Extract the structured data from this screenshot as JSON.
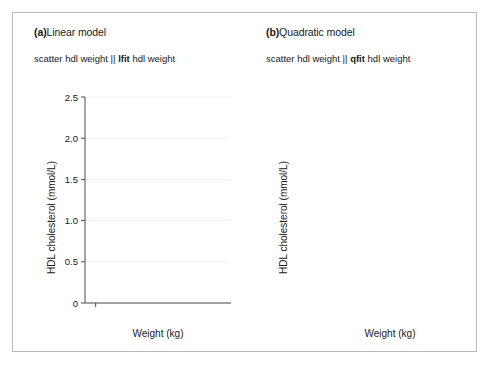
{
  "figure": {
    "background": "#ffffff",
    "border_color": "#b9b9b9",
    "marker_color": "#1c1c1c",
    "fit_color": "#666666",
    "axis_color": "#4d4d4d",
    "grid_color": "#f0f0f0"
  },
  "panels": [
    {
      "id": "a",
      "tag": "(a)",
      "title": "Linear model",
      "subtitle_pre": "scatter hdl weight || ",
      "subtitle_bold": "lfit",
      "subtitle_post": " hdl weight"
    },
    {
      "id": "b",
      "tag": "(b)",
      "title": "Quadratic model",
      "subtitle_pre": "scatter hdl weight || ",
      "subtitle_bold": "qfit",
      "subtitle_post": " hdl weight"
    }
  ],
  "chart_data": [
    {
      "type": "scatter",
      "panel": "a",
      "title": "(a) Linear model",
      "subtitle": "scatter hdl weight || lfit hdl weight",
      "xlabel": "Weight (kg)",
      "ylabel": "HDL cholesterol (mmol/L)",
      "xlim": [
        35,
        103
      ],
      "ylim": [
        0,
        2.5
      ],
      "xticks": [
        40,
        50,
        60,
        70,
        80,
        90,
        100
      ],
      "yticks": [
        0,
        0.5,
        1.0,
        1.5,
        2.0,
        2.5
      ],
      "ytick_labels": [
        "0",
        "0.5",
        "1.0",
        "1.5",
        "2.0",
        "2.5"
      ],
      "grid": "horizontal-faint",
      "legend": "none",
      "fit": {
        "kind": "linear",
        "label": "lfit",
        "x_start": 44.5,
        "y_start": 1.33,
        "x_end": 99.0,
        "y_end": 0.64
      },
      "x": [
        44.0,
        45.5,
        47.0,
        48.0,
        49.0,
        50.0,
        50.5,
        51.0,
        51.5,
        52.0,
        52.5,
        53.0,
        53.5,
        54.0,
        54.5,
        55.0,
        55.0,
        55.5,
        56.0,
        56.0,
        56.5,
        57.0,
        57.0,
        57.5,
        58.0,
        58.0,
        58.5,
        59.0,
        59.0,
        59.5,
        60.0,
        60.0,
        60.5,
        61.0,
        61.0,
        61.5,
        62.0,
        62.0,
        62.5,
        63.0,
        63.0,
        63.5,
        64.0,
        64.0,
        64.5,
        65.0,
        65.0,
        65.5,
        66.0,
        66.0,
        66.5,
        67.0,
        67.0,
        67.5,
        68.0,
        68.0,
        68.5,
        69.0,
        69.0,
        69.5,
        70.0,
        70.0,
        70.5,
        71.0,
        71.0,
        71.5,
        72.0,
        72.0,
        72.5,
        73.0,
        73.5,
        74.0,
        74.5,
        75.0,
        75.5,
        76.0,
        77.0,
        78.0,
        79.0,
        80.0,
        81.0,
        82.0,
        83.0,
        84.0,
        86.0,
        88.0,
        90.0,
        92.0,
        95.0,
        100.0,
        46.0,
        47.5,
        49.5,
        51.0,
        52.5,
        53.5,
        54.5,
        56.0,
        57.5,
        58.5,
        59.5,
        60.5,
        61.5,
        62.5,
        63.5,
        64.5,
        65.5,
        66.5,
        67.5,
        68.5,
        69.5,
        70.5,
        71.5,
        72.5,
        73.5,
        75.0,
        76.5,
        78.5,
        80.5,
        82.5,
        85.0,
        87.0,
        91.0,
        48.5,
        53.0,
        57.0,
        60.0,
        62.0,
        64.0,
        66.0,
        68.0,
        70.0,
        72.0,
        74.0,
        77.5,
        81.5,
        50.5,
        55.0,
        59.0,
        61.0,
        63.0,
        65.0,
        67.0,
        69.0,
        71.0,
        73.0,
        76.0,
        79.5,
        84.5
      ],
      "y": [
        1.92,
        1.74,
        1.36,
        1.27,
        1.11,
        1.38,
        1.23,
        1.05,
        1.48,
        1.3,
        0.99,
        1.18,
        1.52,
        1.4,
        1.07,
        1.29,
        0.88,
        1.56,
        1.21,
        0.96,
        1.34,
        1.13,
        1.63,
        1.42,
        1.25,
        0.91,
        1.08,
        1.31,
        1.5,
        1.16,
        1.02,
        1.27,
        1.44,
        1.19,
        0.93,
        1.36,
        1.1,
        1.28,
        0.85,
        1.22,
        1.41,
        1.04,
        1.15,
        0.97,
        1.33,
        1.2,
        0.9,
        1.26,
        1.09,
        1.38,
        1.01,
        1.17,
        0.83,
        1.24,
        1.06,
        1.31,
        0.95,
        1.13,
        1.29,
        0.87,
        1.18,
        1.02,
        1.22,
        0.94,
        1.1,
        1.25,
        0.86,
        1.15,
        1.03,
        1.19,
        0.92,
        1.08,
        1.21,
        0.98,
        1.12,
        0.89,
        1.05,
        1.16,
        0.95,
        1.09,
        0.84,
        1.14,
        1.01,
        1.23,
        0.97,
        1.07,
        1.92,
        1.03,
        1.1,
        0.37,
        1.85,
        1.6,
        1.2,
        0.81,
        1.44,
        1.05,
        0.94,
        1.35,
        1.01,
        1.47,
        0.79,
        1.26,
        0.88,
        1.12,
        0.97,
        1.53,
        0.82,
        1.3,
        0.91,
        1.06,
        0.76,
        1.21,
        0.99,
        0.86,
        1.18,
        0.93,
        1.08,
        0.8,
        1.24,
        0.95,
        0.89,
        1.02,
        0.74,
        1.17,
        0.85,
        0.71,
        1.03,
        1.95,
        1.66,
        1.31,
        0.78,
        1.09,
        0.72,
        1.28,
        0.83,
        0.96,
        1.4,
        1.56,
        0.75,
        1.33,
        0.68,
        1.49,
        0.87,
        1.14,
        0.64,
        1.07,
        0.98,
        0.73,
        1.19,
        0.9,
        0.66,
        1.25
      ]
    },
    {
      "type": "scatter",
      "panel": "b",
      "title": "(b) Quadratic model",
      "subtitle": "scatter hdl weight || qfit hdl weight",
      "xlabel": "Weight (kg)",
      "ylabel": "HDL cholesterol (mmol/L)",
      "xlim": [
        35,
        103
      ],
      "ylim": [
        0,
        2.5
      ],
      "xticks": [
        40,
        50,
        60,
        70,
        80,
        90,
        100
      ],
      "yticks": [
        0,
        0.5,
        1.0,
        1.5,
        2.0,
        2.5
      ],
      "ytick_labels": [
        "0",
        "0.5",
        "1.0",
        "1.5",
        "2.0",
        "2.5"
      ],
      "grid": "horizontal-faint",
      "legend": "none",
      "fit": {
        "kind": "quadratic",
        "label": "qfit",
        "x_start": 43.0,
        "y_start": 1.46,
        "vertex_x": 86.0,
        "vertex_y": 0.98,
        "x_end": 99.5,
        "y_end": 1.01,
        "samples_x": [
          43,
          48,
          53,
          58,
          63,
          68,
          73,
          78,
          83,
          88,
          93,
          99.5
        ],
        "samples_y": [
          1.46,
          1.35,
          1.26,
          1.18,
          1.12,
          1.07,
          1.03,
          1.0,
          0.985,
          0.98,
          0.99,
          1.01
        ]
      },
      "shares_points_with": "a"
    }
  ],
  "axes": {
    "ylabel": "HDL cholesterol (mmol/L)",
    "xlabel": "Weight (kg)",
    "ytick_labels": [
      "2.5",
      "2.0",
      "1.5",
      "1.0",
      "0.5",
      "0"
    ],
    "xtick_labels": [
      "40",
      "50",
      "60",
      "70",
      "80",
      "90",
      "100"
    ]
  }
}
